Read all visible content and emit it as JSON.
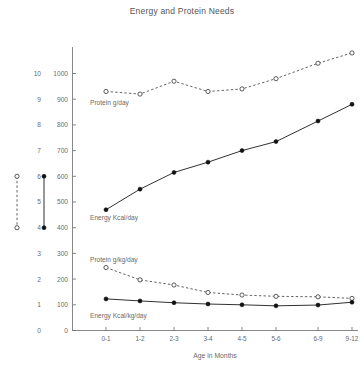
{
  "chart_data": {
    "type": "line",
    "title": "Energy and Protein Needs",
    "xlabel": "Age in Months",
    "ylabel": "",
    "categories": [
      "0-1",
      "1-2",
      "2-3",
      "3-4",
      "4-5",
      "5-6",
      "6-9",
      "9-12"
    ],
    "grid": false,
    "legend_position": "inline-labels",
    "primary_axis": {
      "name": "energy-axis",
      "ylim": [
        0,
        1000
      ],
      "ticks": [
        0,
        100,
        200,
        300,
        400,
        500,
        600,
        700,
        800,
        900,
        1000
      ],
      "tick_labels": [
        "0",
        "100",
        "200",
        "300",
        "400",
        "500",
        "600",
        "700",
        "800",
        "900",
        "1000"
      ]
    },
    "secondary_axis": {
      "name": "protein-axis",
      "ylim": [
        0,
        10
      ],
      "ticks": [
        0,
        1,
        2,
        3,
        4,
        5,
        6,
        7,
        8,
        9,
        10
      ],
      "tick_labels": [
        "0",
        "1",
        "2",
        "3",
        "4",
        "5",
        "6",
        "7",
        "8",
        "9",
        "10"
      ]
    },
    "series": [
      {
        "name": "Protein g/day",
        "axis": "secondary",
        "style": "dashed",
        "marker": "open-circle",
        "values": [
          9.3,
          9.2,
          9.7,
          9.3,
          9.4,
          9.8,
          10.4,
          10.8
        ]
      },
      {
        "name": "Energy Kcal/day",
        "axis": "primary",
        "style": "solid",
        "marker": "filled-circle",
        "values": [
          470,
          550,
          615,
          655,
          700,
          735,
          815,
          880
        ]
      },
      {
        "name": "Protein g/kg/day",
        "axis": "secondary",
        "style": "dashed",
        "marker": "open-circle",
        "values": [
          2.45,
          1.97,
          1.77,
          1.48,
          1.38,
          1.33,
          1.31,
          1.25
        ]
      },
      {
        "name": "Energy Kcal/kg/day",
        "axis": "primary",
        "style": "solid",
        "marker": "filled-circle",
        "values": [
          123,
          115,
          108,
          103,
          100,
          96,
          99,
          110
        ]
      }
    ],
    "legend_keys": [
      {
        "name": "protein-key",
        "style": "dashed",
        "marker": "open-circle",
        "from": 4,
        "to": 6
      },
      {
        "name": "energy-key",
        "style": "solid",
        "marker": "filled-circle",
        "from": 4,
        "to": 6
      }
    ],
    "colors": {
      "axis": "#6a6a6a",
      "text": "#6a6a6a",
      "solid_series": "#111111",
      "dashed_series": "#333333",
      "background": "#ffffff"
    }
  }
}
